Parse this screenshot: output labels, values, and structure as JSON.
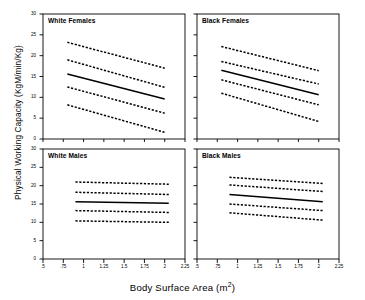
{
  "chart_data": {
    "type": "line",
    "title": "",
    "xlabel": "Body Surface Area (m2)",
    "xlabel_main": "Body Surface Area (m",
    "xlabel_sup": "2",
    "xlabel_tail": ")",
    "ylabel": "Physical Working Capacity (KgM/min/Kg)",
    "xlim": [
      0.5,
      2.25
    ],
    "ylim": [
      0,
      30
    ],
    "xticks": [
      0.5,
      0.75,
      1,
      1.25,
      1.5,
      1.75,
      2,
      2.25
    ],
    "xticklabels": [
      ".5",
      ".75",
      "1",
      "1.25",
      "1.5",
      "1.75",
      "2",
      "2.25"
    ],
    "yticks": [
      0,
      5,
      10,
      15,
      20,
      25,
      30
    ],
    "yticklabels": [
      "0",
      "5",
      "10",
      "15",
      "20",
      "25",
      "30"
    ],
    "grid": false,
    "legend": "none",
    "line_color": "#000000",
    "panel_layout": "2x2",
    "panels": [
      {
        "name": "white-females",
        "label": "White Females",
        "position": "top-left",
        "x_range": [
          0.8,
          2.0
        ],
        "series": [
          {
            "name": "upper-95",
            "style": "dashed",
            "values": [
              23.2,
              17.0
            ]
          },
          {
            "name": "upper-50",
            "style": "dashed",
            "values": [
              19.0,
              12.4
            ]
          },
          {
            "name": "mean",
            "style": "solid",
            "values": [
              15.6,
              9.6
            ]
          },
          {
            "name": "lower-50",
            "style": "dashed",
            "values": [
              12.5,
              6.2
            ]
          },
          {
            "name": "lower-95",
            "style": "dashed",
            "values": [
              8.2,
              1.6
            ]
          }
        ]
      },
      {
        "name": "black-females",
        "label": "Black Females",
        "position": "top-right",
        "x_range": [
          0.8,
          2.0
        ],
        "series": [
          {
            "name": "upper-95",
            "style": "dashed",
            "values": [
              22.2,
              16.4
            ]
          },
          {
            "name": "upper-50",
            "style": "dashed",
            "values": [
              18.6,
              13.2
            ]
          },
          {
            "name": "mean",
            "style": "solid",
            "values": [
              16.5,
              10.6
            ]
          },
          {
            "name": "lower-50",
            "style": "dashed",
            "values": [
              14.2,
              8.2
            ]
          },
          {
            "name": "lower-95",
            "style": "dashed",
            "values": [
              11.0,
              4.2
            ]
          }
        ]
      },
      {
        "name": "white-males",
        "label": "White Males",
        "position": "bottom-left",
        "x_range": [
          0.9,
          2.05
        ],
        "series": [
          {
            "name": "upper-95",
            "style": "dashed",
            "values": [
              21.0,
              20.4
            ]
          },
          {
            "name": "upper-50",
            "style": "dashed",
            "values": [
              18.2,
              17.6
            ]
          },
          {
            "name": "mean",
            "style": "solid",
            "values": [
              15.6,
              15.2
            ]
          },
          {
            "name": "lower-50",
            "style": "dashed",
            "values": [
              13.2,
              12.7
            ]
          },
          {
            "name": "lower-95",
            "style": "dashed",
            "values": [
              10.4,
              10.0
            ]
          }
        ]
      },
      {
        "name": "black-males",
        "label": "Black Males",
        "position": "bottom-right",
        "x_range": [
          0.9,
          2.05
        ],
        "series": [
          {
            "name": "upper-95",
            "style": "dashed",
            "values": [
              22.3,
              20.6
            ]
          },
          {
            "name": "upper-50",
            "style": "dashed",
            "values": [
              20.2,
              18.4
            ]
          },
          {
            "name": "mean",
            "style": "solid",
            "values": [
              17.6,
              15.6
            ]
          },
          {
            "name": "lower-50",
            "style": "dashed",
            "values": [
              15.0,
              13.2
            ]
          },
          {
            "name": "lower-95",
            "style": "dashed",
            "values": [
              12.6,
              10.6
            ]
          }
        ]
      }
    ]
  }
}
